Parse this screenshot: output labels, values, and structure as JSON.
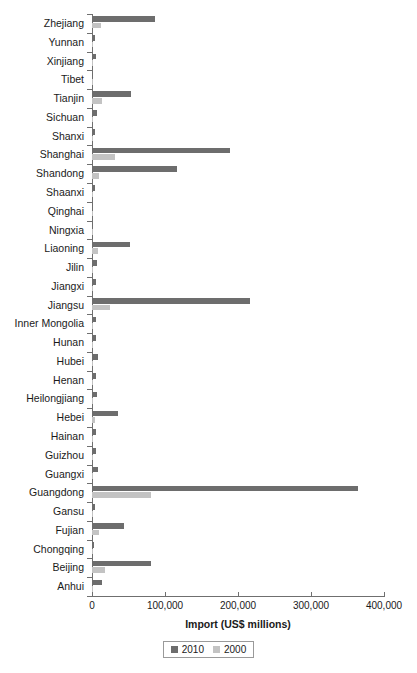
{
  "chart_data": {
    "type": "bar",
    "orientation": "horizontal",
    "title": "",
    "xlabel": "Import (US$ millions)",
    "ylabel": "",
    "xlim": [
      0,
      400000
    ],
    "xticks": [
      0,
      100000,
      200000,
      300000,
      400000
    ],
    "xtick_labels": [
      "0",
      "100,000",
      "200,000",
      "300,000",
      "400,000"
    ],
    "grid": false,
    "legend_position": "bottom-center",
    "categories": [
      "Zhejiang",
      "Yunnan",
      "Xinjiang",
      "Tibet",
      "Tianjin",
      "Sichuan",
      "Shanxi",
      "Shanghai",
      "Shandong",
      "Shaanxi",
      "Qinghai",
      "Ningxia",
      "Liaoning",
      "Jilin",
      "Jiangxi",
      "Jiangsu",
      "Inner Mongolia",
      "Hunan",
      "Hubei",
      "Henan",
      "Heilongjiang",
      "Hebei",
      "Hainan",
      "Guizhou",
      "Guangxi",
      "Guangdong",
      "Gansu",
      "Fujian",
      "Chongqing",
      "Beijing",
      "Anhui"
    ],
    "series": [
      {
        "name": "2010",
        "color": "#6d6d6d",
        "values": [
          86000,
          3500,
          5500,
          300,
          53000,
          7500,
          4500,
          189000,
          117000,
          4500,
          300,
          400,
          52000,
          7500,
          5000,
          216000,
          6000,
          5000,
          8000,
          5500,
          7000,
          35000,
          5500,
          5000,
          8000,
          365000,
          3500,
          44000,
          3000,
          81000,
          14000
        ]
      },
      {
        "name": "2000",
        "color": "#c3c3c3",
        "values": [
          13000,
          500,
          600,
          50,
          14000,
          1200,
          700,
          31000,
          9000,
          900,
          40,
          60,
          8000,
          900,
          800,
          24000,
          900,
          800,
          1200,
          900,
          1100,
          3500,
          800,
          700,
          1200,
          81000,
          400,
          10000,
          400,
          18000,
          1000
        ]
      }
    ]
  },
  "legend": {
    "items": [
      {
        "label": "2010",
        "color": "#6d6d6d"
      },
      {
        "label": "2000",
        "color": "#c3c3c3"
      }
    ]
  }
}
